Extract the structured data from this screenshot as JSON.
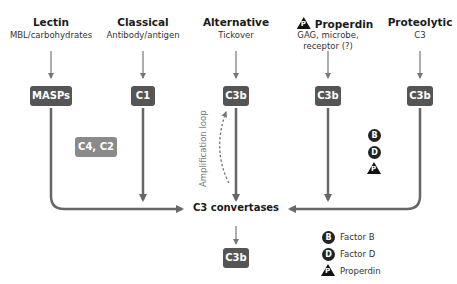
{
  "pathways": [
    {
      "title": "Lectin",
      "subtitle": "MBL/carbohydrates",
      "box": "MASPs"
    },
    {
      "title": "Classical",
      "subtitle": "Antibody/antigen",
      "box": "C1"
    },
    {
      "title": "Alternative",
      "subtitle": "Tickover",
      "box": "C3b"
    },
    {
      "title": "Properdin",
      "subtitle_line1": "GAG, microbe,",
      "subtitle_line2": "receptor (?)",
      "box": "C3b",
      "title_icon": "P"
    },
    {
      "title": "Proteolytic",
      "subtitle": "C3",
      "box": "C3b"
    }
  ],
  "classical_cofactors": "C4, C2",
  "amplification_label": "Amplification loop",
  "convertase_label": "C3 convertases",
  "output_box": "C3b",
  "factor_badges": [
    "B",
    "D",
    "P"
  ],
  "legend": [
    {
      "symbol": "B",
      "shape": "circle",
      "label": "Factor B"
    },
    {
      "symbol": "D",
      "shape": "circle",
      "label": "Factor D"
    },
    {
      "symbol": "P",
      "shape": "triangle",
      "label": "Properdin"
    }
  ],
  "colors": {
    "box": "#555555",
    "box_light": "#8a8a8a",
    "arrow": "#666666",
    "badge": "#222222"
  }
}
